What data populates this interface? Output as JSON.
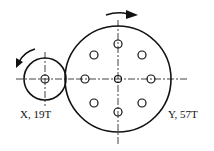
{
  "gears": {
    "small": {
      "label": "X, 19T",
      "teeth": 19,
      "rotation": "counterclockwise"
    },
    "large": {
      "label": "Y, 57T",
      "teeth": 57,
      "rotation": "clockwise",
      "holes": 8
    }
  },
  "colors": {
    "stroke": "#111111",
    "background": "#ffffff"
  }
}
